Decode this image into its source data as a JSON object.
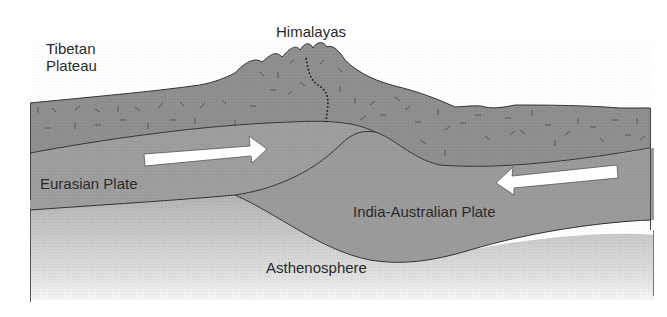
{
  "diagram": {
    "labels": {
      "tibetan_plateau_line1": "Tibetan",
      "tibetan_plateau_line2": "Plateau",
      "himalayas": "Himalayas",
      "eurasian_plate": "Eurasian Plate",
      "india_australian_plate": "India-Australian Plate",
      "asthenosphere": "Asthenosphere"
    },
    "arrows": [
      {
        "name": "eurasian-plate-motion",
        "direction": "right"
      },
      {
        "name": "india-plate-motion",
        "direction": "left"
      }
    ],
    "colors": {
      "crust": "#8f8f8f",
      "plate": "#9c9c9c",
      "asthenosphere_top": "#b4b4b4",
      "asthenosphere_bottom": "#f4f4f4",
      "outline": "#333333",
      "arrow": "#ffffff"
    }
  }
}
